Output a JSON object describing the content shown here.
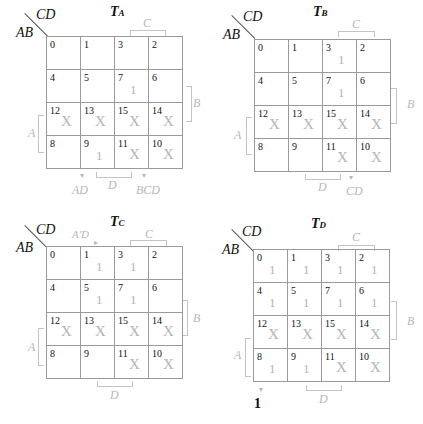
{
  "row_var": "AB",
  "col_var": "CD",
  "cell_order": [
    [
      0,
      1,
      3,
      2
    ],
    [
      4,
      5,
      7,
      6
    ],
    [
      12,
      13,
      15,
      14
    ],
    [
      8,
      9,
      11,
      10
    ]
  ],
  "maps": [
    {
      "id": "TA",
      "title_main": "T",
      "title_sub": "A",
      "values": [
        [
          "",
          "",
          "",
          ""
        ],
        [
          "",
          "",
          "1",
          ""
        ],
        [
          "X",
          "X",
          "X",
          "X"
        ],
        [
          "",
          "1",
          "X",
          "X"
        ]
      ],
      "group_labels": {
        "c": "C",
        "b": "B",
        "a": "A",
        "d": "D"
      },
      "annotations": [
        "AD",
        "BCD"
      ]
    },
    {
      "id": "TB",
      "title_main": "T",
      "title_sub": "B",
      "values": [
        [
          "",
          "",
          "1",
          ""
        ],
        [
          "",
          "",
          "1",
          ""
        ],
        [
          "X",
          "X",
          "X",
          "X"
        ],
        [
          "",
          "",
          "X",
          "X"
        ]
      ],
      "group_labels": {
        "c": "C",
        "b": "B",
        "a": "A",
        "d": "D"
      },
      "annotations": [
        "CD"
      ]
    },
    {
      "id": "TC",
      "title_main": "T",
      "title_sub": "C",
      "values": [
        [
          "",
          "1",
          "1",
          ""
        ],
        [
          "",
          "1",
          "1",
          ""
        ],
        [
          "X",
          "X",
          "X",
          "X"
        ],
        [
          "",
          "",
          "X",
          "X"
        ]
      ],
      "group_labels": {
        "c": "C",
        "b": "B",
        "a": "A",
        "d": "D"
      },
      "annotations": [
        "A'D"
      ]
    },
    {
      "id": "TD",
      "title_main": "T",
      "title_sub": "D",
      "values": [
        [
          "1",
          "1",
          "1",
          "1"
        ],
        [
          "1",
          "1",
          "1",
          "1"
        ],
        [
          "X",
          "X",
          "X",
          "X"
        ],
        [
          "1",
          "1",
          "X",
          "X"
        ]
      ],
      "group_labels": {
        "c": "C",
        "b": "B",
        "a": "A",
        "d": "D"
      },
      "annotations": [
        "1"
      ]
    }
  ]
}
